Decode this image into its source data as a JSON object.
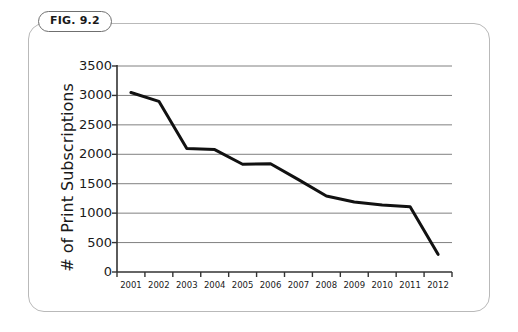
{
  "figure": {
    "badge_label": "FIG. 9.2"
  },
  "chart_data": {
    "type": "line",
    "title": "",
    "xlabel": "",
    "ylabel": "# of Print Subscriptions",
    "categories": [
      "2001",
      "2002",
      "2003",
      "2004",
      "2005",
      "2006",
      "2007",
      "2008",
      "2009",
      "2010",
      "2011",
      "2012"
    ],
    "x": [
      2001,
      2002,
      2003,
      2004,
      2005,
      2006,
      2007,
      2008,
      2009,
      2010,
      2011,
      2012
    ],
    "values": [
      3050,
      2900,
      2100,
      2080,
      1830,
      1840,
      1570,
      1290,
      1190,
      1140,
      1110,
      300
    ],
    "series": [
      {
        "name": "# of Print Subscriptions",
        "values": [
          3050,
          2900,
          2100,
          2080,
          1830,
          1840,
          1570,
          1290,
          1190,
          1140,
          1110,
          300
        ]
      }
    ],
    "ylim": [
      0,
      3500
    ],
    "yticks": [
      0,
      500,
      1000,
      1500,
      2000,
      2500,
      3000,
      3500
    ],
    "ytick_labels": [
      "0",
      "500",
      "1000",
      "1500",
      "2000",
      "2500",
      "3000",
      "3500"
    ],
    "grid": true,
    "grid_axis": "y",
    "legend": false,
    "legend_position": "none",
    "line_color": "#111111",
    "grid_color": "#808080",
    "axis_color": "#333333",
    "frame_color": "#b9b9b9"
  }
}
